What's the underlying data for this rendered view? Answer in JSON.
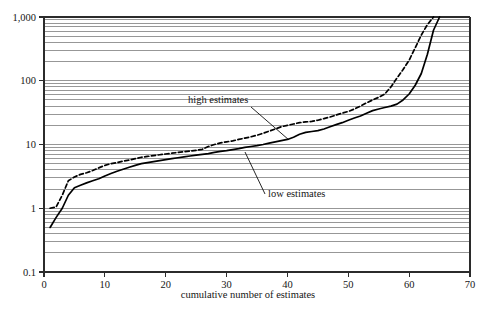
{
  "chart_data": {
    "type": "line",
    "title": "",
    "subtitle": "",
    "xlabel": "cumulative number of estimates",
    "ylabel": "",
    "xlim": [
      0,
      70
    ],
    "ylim": [
      0.1,
      1000
    ],
    "yscale": "log",
    "xscale": "linear",
    "grid": "horizontal log-minor gridlines",
    "legend_position": "inline annotations with leader lines",
    "xticks": [
      0,
      10,
      20,
      30,
      40,
      50,
      60,
      70
    ],
    "xticklabels": [
      "0",
      "10",
      "20",
      "30",
      "40",
      "50",
      "60",
      "70"
    ],
    "yticks": [
      0.1,
      1,
      10,
      100,
      1000
    ],
    "yticklabels": [
      "0.1",
      "1",
      "10",
      "100",
      "1,000"
    ],
    "annotations": [
      {
        "text": "high estimates",
        "x": 31,
        "y": 58
      },
      {
        "text": "low estimates",
        "x": 44,
        "y": 4.1
      }
    ],
    "series": [
      {
        "name": "high estimates",
        "style": "dashed",
        "x": [
          1,
          2,
          3,
          4,
          5,
          6,
          7,
          8,
          9,
          10,
          11,
          12,
          13,
          14,
          15,
          16,
          17,
          18,
          19,
          20,
          21,
          22,
          23,
          24,
          25,
          26,
          27,
          28,
          29,
          30,
          31,
          32,
          33,
          34,
          35,
          36,
          37,
          38,
          39,
          40,
          41,
          42,
          43,
          44,
          45,
          46,
          47,
          48,
          49,
          50,
          51,
          52,
          53,
          54,
          55,
          56,
          57,
          58,
          59,
          60,
          61,
          62,
          63,
          64
        ],
        "y": [
          1.0,
          1.05,
          1.6,
          2.7,
          3.1,
          3.4,
          3.6,
          3.9,
          4.3,
          4.7,
          5.0,
          5.2,
          5.5,
          5.7,
          6.0,
          6.3,
          6.5,
          6.7,
          6.9,
          7.1,
          7.3,
          7.5,
          7.7,
          7.9,
          8.1,
          8.4,
          9.3,
          10.0,
          10.6,
          11.0,
          11.4,
          12.0,
          12.6,
          13.2,
          14.0,
          15.0,
          16.2,
          17.5,
          19.0,
          20.0,
          21.0,
          22.0,
          22.6,
          23.0,
          24.0,
          25.5,
          27.0,
          29.0,
          31.0,
          33.0,
          36.0,
          40.0,
          45.0,
          50.0,
          55.0,
          62.0,
          80.0,
          110.0,
          150.0,
          210.0,
          330.0,
          520.0,
          760.0,
          1000.0
        ]
      },
      {
        "name": "low estimates",
        "style": "solid",
        "x": [
          1,
          2,
          3,
          4,
          5,
          6,
          7,
          8,
          9,
          10,
          11,
          12,
          13,
          14,
          15,
          16,
          17,
          18,
          19,
          20,
          21,
          22,
          23,
          24,
          25,
          26,
          27,
          28,
          29,
          30,
          31,
          32,
          33,
          34,
          35,
          36,
          37,
          38,
          39,
          40,
          41,
          42,
          43,
          44,
          45,
          46,
          47,
          48,
          49,
          50,
          51,
          52,
          53,
          54,
          55,
          56,
          57,
          58,
          59,
          60,
          61,
          62,
          63,
          64,
          65
        ],
        "y": [
          0.5,
          0.72,
          1.0,
          1.6,
          2.1,
          2.3,
          2.5,
          2.7,
          2.9,
          3.2,
          3.5,
          3.8,
          4.1,
          4.4,
          4.7,
          5.0,
          5.2,
          5.4,
          5.6,
          5.8,
          6.0,
          6.2,
          6.4,
          6.6,
          6.8,
          7.0,
          7.2,
          7.5,
          7.8,
          8.0,
          8.3,
          8.6,
          9.0,
          9.3,
          9.6,
          10.0,
          10.5,
          11.0,
          11.5,
          12.0,
          13.0,
          14.5,
          15.5,
          16.0,
          16.5,
          17.5,
          19.0,
          20.5,
          22.0,
          24.0,
          26.0,
          28.0,
          31.0,
          34.0,
          36.0,
          38.0,
          40.0,
          43.0,
          50.0,
          62.0,
          85.0,
          130.0,
          260.0,
          620.0,
          1000.0
        ]
      }
    ]
  },
  "axes": {
    "x_label": "cumulative number of estimates",
    "x_ticks": [
      "0",
      "10",
      "20",
      "30",
      "40",
      "50",
      "60",
      "70"
    ],
    "y_ticks": [
      "1,000",
      "100",
      "10",
      "1",
      "0.1"
    ]
  },
  "annotations": {
    "high": "high estimates",
    "low": "low estimates"
  },
  "colors": {
    "line": "#000000",
    "grid": "#8c8c8c",
    "frame": "#2b2b2b",
    "background": "#ffffff"
  }
}
